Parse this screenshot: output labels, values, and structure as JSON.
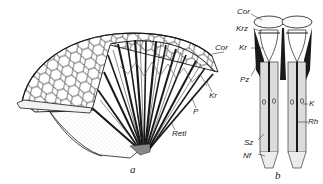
{
  "figure": {
    "panels": [
      {
        "id": "a",
        "caption": "a",
        "description": "Cutaway view of a compound eye: hexagonal facet surface with radially arranged ommatidia",
        "labels": [
          "Cor",
          "Kr",
          "P",
          "Retl"
        ]
      },
      {
        "id": "b",
        "caption": "b",
        "description": "Two isolated ommatidia in longitudinal section",
        "labels": [
          "Cor",
          "Krz",
          "Kr",
          "Pz",
          "K",
          "Rh",
          "Sz",
          "Nf"
        ]
      }
    ]
  },
  "labels_a": {
    "cor": "Cor",
    "kr": "Kr",
    "p": "P",
    "retl": "Retl",
    "caption": "a"
  },
  "labels_b": {
    "cor": "Cor",
    "krz": "Krz",
    "kr": "Kr",
    "pz": "Pz",
    "k": "K",
    "rh": "Rh",
    "sz": "Sz",
    "nf": "Nf",
    "caption": "b"
  },
  "colors": {
    "ink": "#1a1a1a",
    "shade": "#9a9a9a",
    "fill_light": "#e6e6e6",
    "background": "#ffffff"
  }
}
